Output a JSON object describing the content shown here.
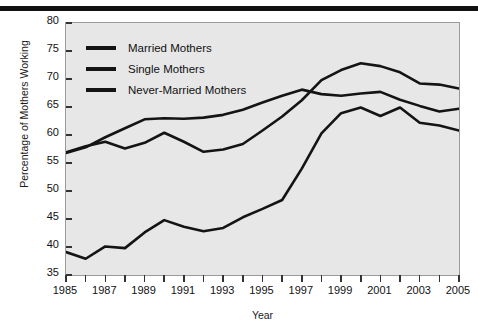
{
  "figure": {
    "background_color": "#ffffff",
    "plot_background_color": "#e7e7e7",
    "line_color": "#141414",
    "rule_color": "#111111"
  },
  "chart_data": {
    "type": "line",
    "title": "",
    "xlabel": "Year",
    "ylabel": "Percentage of Mothers Working",
    "xlim": [
      1985,
      2005
    ],
    "ylim": [
      35,
      80
    ],
    "ytick_step": 5,
    "yticks": [
      35,
      40,
      45,
      50,
      55,
      60,
      65,
      70,
      75,
      80
    ],
    "xticks_labeled": [
      1985,
      1987,
      1989,
      1991,
      1993,
      1995,
      1997,
      1999,
      2001,
      2003,
      2005
    ],
    "xtick_minor_step": 1,
    "grid": false,
    "legend_position": "upper left",
    "x": [
      1985,
      1986,
      1987,
      1988,
      1989,
      1990,
      1991,
      1992,
      1993,
      1994,
      1995,
      1996,
      1997,
      1998,
      1999,
      2000,
      2001,
      2002,
      2003,
      2004,
      2005
    ],
    "series": [
      {
        "name": "Married Mothers",
        "values": [
          56.8,
          57.8,
          59.6,
          61.2,
          62.8,
          63.0,
          62.9,
          63.1,
          63.6,
          64.5,
          65.8,
          67.0,
          68.1,
          67.3,
          67.0,
          67.4,
          67.7,
          66.3,
          65.2,
          64.2,
          64.7
        ]
      },
      {
        "name": "Single Mothers",
        "values": [
          56.9,
          58.0,
          58.8,
          57.6,
          58.6,
          60.4,
          58.8,
          57.0,
          57.4,
          58.4,
          60.8,
          63.3,
          66.2,
          69.8,
          71.6,
          72.8,
          72.3,
          71.2,
          69.2,
          69.0,
          68.3
        ]
      },
      {
        "name": "Never-Married Mothers",
        "values": [
          39.1,
          37.9,
          40.1,
          39.8,
          42.6,
          44.8,
          43.6,
          42.8,
          43.4,
          45.3,
          46.8,
          48.4,
          54.0,
          60.3,
          63.9,
          64.9,
          63.4,
          64.9,
          62.2,
          61.7,
          60.8
        ]
      }
    ]
  },
  "legend": {
    "items": [
      {
        "label": "Married Mothers"
      },
      {
        "label": "Single Mothers"
      },
      {
        "label": "Never-Married Mothers"
      }
    ]
  },
  "axes": {
    "y_title": "Percentage of Mothers Working",
    "x_title": "Year"
  }
}
